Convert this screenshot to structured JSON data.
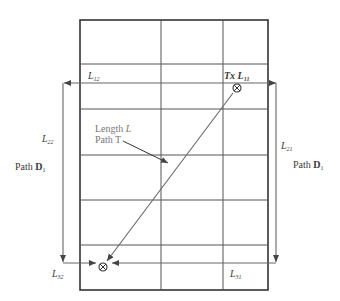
{
  "diagram": {
    "grid": {
      "rows": 6,
      "columns": 3
    },
    "transmitter": {
      "label": "Tx",
      "id": "L",
      "sub": "11"
    },
    "receiver": {
      "symbol": "⊗"
    },
    "labels": {
      "l12": {
        "main": "L",
        "sub": "12"
      },
      "l22": {
        "main": "L",
        "sub": "22"
      },
      "l21": {
        "main": "L",
        "sub": "21"
      },
      "l32": {
        "main": "L",
        "sub": "32"
      },
      "l31": {
        "main": "L",
        "sub": "31"
      },
      "path_d1_left": {
        "prefix": "Path ",
        "main": "D",
        "sub": "1"
      },
      "path_d1_right": {
        "prefix": "Path ",
        "main": "D",
        "sub": "1"
      },
      "length_line1_prefix": "Length ",
      "length_line1_var": "L",
      "length_line2": "Path T"
    },
    "colors": {
      "grid": "#333333",
      "path": "#666666",
      "text": "#3a3a3a",
      "annotation": "#777777"
    }
  }
}
